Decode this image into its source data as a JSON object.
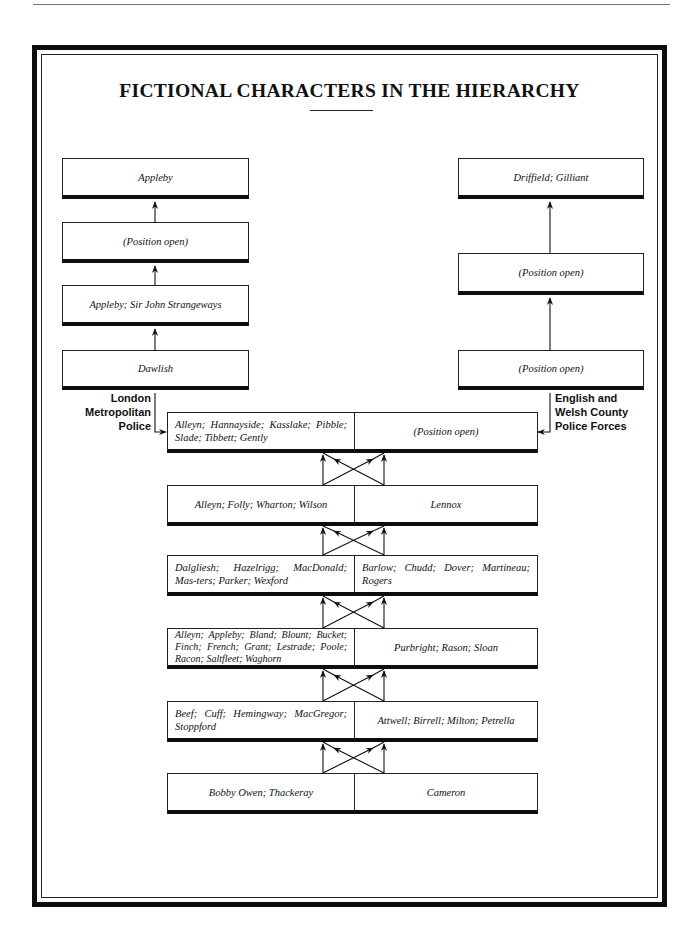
{
  "title": "FICTIONAL CHARACTERS IN THE HIERARCHY",
  "left_column": {
    "label": [
      "London",
      "Metropolitan",
      "Police"
    ],
    "boxes": [
      {
        "text": "Appleby"
      },
      {
        "text": "(Position open)"
      },
      {
        "text": "Appleby; Sir John Strangeways"
      },
      {
        "text": "Dawlish"
      }
    ]
  },
  "right_column": {
    "label": [
      "English and",
      "Welsh County",
      "Police Forces"
    ],
    "boxes": [
      {
        "text": "Driffield; Gilliant"
      },
      {
        "text": "(Position open)"
      },
      {
        "text": "(Position open)"
      }
    ]
  },
  "center_rows": [
    {
      "left": "Alleyn; Hannayside; Kasslake; Pibble; Slade; Tibbett; Gently",
      "right": "(Position open)"
    },
    {
      "left": "Alleyn; Folly; Wharton; Wilson",
      "right": "Lennox"
    },
    {
      "left": "Dalgliesh; Hazelrigg; MacDonald; Mas-ters; Parker; Wexford",
      "right": "Barlow; Chudd; Dover; Martineau; Rogers"
    },
    {
      "left": "Alleyn; Appleby; Bland; Blount; Bucket; Finch; French; Grant; Lestrade; Poole; Racon; Saltfleet; Waghorn",
      "right": "Purbright; Rason; Sloan"
    },
    {
      "left": "Beef; Cuff; Hemingway; MacGregor; Stoppford",
      "right": "Attwell; Birrell; Milton; Petrella"
    },
    {
      "left": "Bobby Owen; Thackeray",
      "right": "Cameron"
    }
  ],
  "colors": {
    "ink": "#0d0d0d",
    "paper": "#ffffff"
  }
}
